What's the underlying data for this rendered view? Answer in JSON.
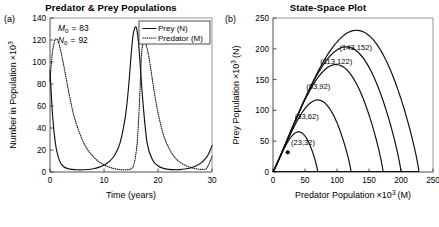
{
  "figure": {
    "panels": [
      {
        "letter": "(a)",
        "title": "Predator & Prey Populations"
      },
      {
        "letter": "(b)",
        "title": "State-Space Plot"
      }
    ]
  },
  "chart_data": [
    {
      "type": "line",
      "panel": "a",
      "title": "Predator & Prey Populations",
      "xlabel": "Time (years)",
      "ylabel": "Number in Population ×10³",
      "xlim": [
        0,
        30
      ],
      "ylim": [
        0,
        140
      ],
      "xticks": [
        0,
        10,
        20,
        30
      ],
      "yticks": [
        0,
        20,
        40,
        60,
        80,
        100,
        120,
        140
      ],
      "grid": false,
      "legend_position": "top-right",
      "annotations": [
        {
          "name": "M0",
          "symbol": "M",
          "subscript": "0",
          "equals": "=",
          "value": "83"
        },
        {
          "name": "N0",
          "symbol": "N",
          "subscript": "0",
          "equals": "=",
          "value": "92"
        }
      ],
      "series": [
        {
          "name": "Prey (N)",
          "style": "solid",
          "initial_value": 92,
          "peak_value": 132,
          "peak_times": [
            0.0,
            15.9,
            30.0
          ],
          "trough_value": 2,
          "trough_times": [
            4.5,
            20.5
          ],
          "period_years": 15.9,
          "points_t": [
            0,
            0.5,
            1,
            1.5,
            2,
            2.5,
            3,
            3.5,
            4,
            5,
            6,
            7,
            8,
            9,
            10,
            11,
            12,
            13,
            14,
            14.6,
            15,
            15.4,
            15.9,
            16.3,
            16.7,
            17.2,
            18,
            19,
            20,
            21,
            22,
            23,
            24,
            25,
            26,
            27,
            28,
            29,
            29.5,
            30
          ],
          "points_n": [
            92,
            50,
            26,
            14,
            8,
            5,
            3.5,
            2.8,
            2.4,
            2.0,
            2.0,
            2.3,
            3.0,
            4.2,
            6.2,
            9.6,
            15.5,
            27,
            52,
            80,
            105,
            125,
            132,
            122,
            98,
            64,
            26,
            11,
            5.5,
            3.3,
            2.4,
            2.1,
            2.2,
            2.7,
            3.7,
            5.4,
            8.3,
            13.5,
            18,
            24
          ]
        },
        {
          "name": "Predator (M)",
          "style": "dotted",
          "initial_value": 83,
          "peak_value": 121,
          "peak_times": [
            1.1,
            17.0
          ],
          "trough_value": 1.5,
          "trough_times": [
            11.5,
            27.0
          ],
          "period_years": 15.9,
          "points_t": [
            0,
            0.4,
            0.8,
            1.1,
            1.5,
            2,
            2.5,
            3,
            3.5,
            4,
            4.5,
            5,
            6,
            7,
            8,
            9,
            10,
            11,
            12,
            13,
            14,
            15,
            15.6,
            16.2,
            16.7,
            17.0,
            17.5,
            18,
            18.6,
            19.2,
            20,
            21,
            22,
            23,
            24,
            25,
            26,
            27,
            28,
            29,
            30
          ],
          "points_m": [
            83,
            107,
            118,
            121,
            119,
            110,
            98,
            85,
            72,
            60,
            50,
            42,
            29,
            20,
            14,
            9.5,
            6.5,
            4.4,
            3.0,
            2.2,
            2.0,
            3.0,
            8,
            30,
            78,
            110,
            118,
            112,
            96,
            76,
            54,
            34,
            22,
            14,
            9.2,
            6.2,
            4.2,
            3.0,
            2.4,
            3.5,
            14
          ]
        }
      ]
    },
    {
      "type": "line",
      "panel": "b",
      "title": "State-Space Plot",
      "xlabel": "Predator Population ×10³ (M)",
      "ylabel": "Prey Population ×10³ (N)",
      "xlim": [
        0,
        250
      ],
      "ylim": [
        0,
        250
      ],
      "xticks": [
        0,
        50,
        100,
        150,
        200,
        250
      ],
      "yticks": [
        0,
        50,
        100,
        150,
        200,
        250
      ],
      "grid": false,
      "marker": {
        "label": "(23,32)",
        "x": 23,
        "y": 32
      },
      "orbits": [
        {
          "label": "(23,32)",
          "initial_M": 23,
          "initial_N": 32,
          "max_M": 70,
          "max_N": 68,
          "label_x": 28,
          "label_y": 44
        },
        {
          "label": "(53,62)",
          "initial_M": 53,
          "initial_N": 62,
          "max_M": 122,
          "max_N": 122,
          "label_x": 34,
          "label_y": 86
        },
        {
          "label": "(83,92)",
          "initial_M": 83,
          "initial_N": 92,
          "max_M": 172,
          "max_N": 182,
          "label_x": 52,
          "label_y": 134
        },
        {
          "label": "(113,122)",
          "initial_M": 113,
          "initial_N": 122,
          "max_M": 200,
          "max_N": 212,
          "label_x": 74,
          "label_y": 176
        },
        {
          "label": "(143,152)",
          "initial_M": 143,
          "initial_N": 152,
          "max_M": 228,
          "max_N": 240,
          "label_x": 104,
          "label_y": 198
        }
      ]
    }
  ]
}
